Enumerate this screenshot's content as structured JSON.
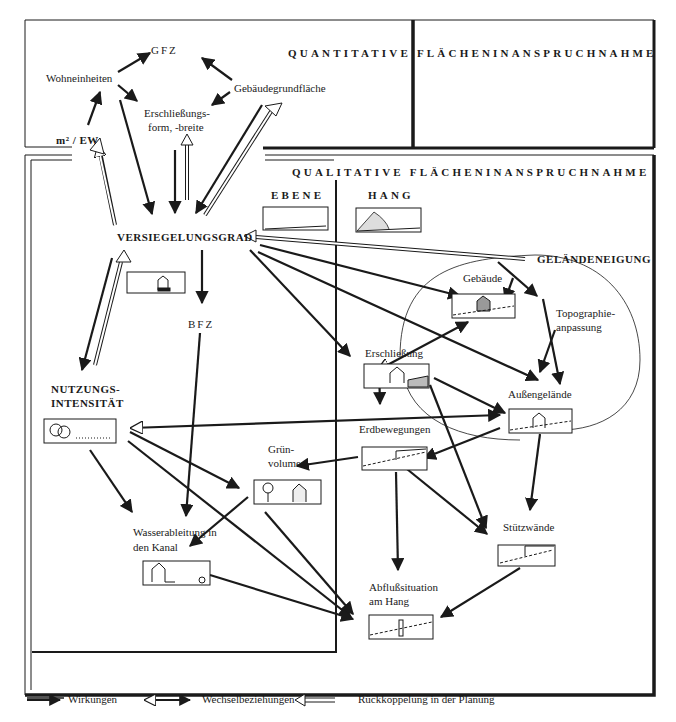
{
  "sections": {
    "quantitative_title": "QUANTITATIVE FLÄCHENINANSPRUCHNAHME",
    "qualitative_title": "QUALITATIVE FLÄCHENINANSPRUCHNAHME",
    "ebene": "EBENE",
    "hang": "HANG"
  },
  "nodes": {
    "gfz": "GFZ",
    "wohneinheiten": "Wohneinheiten",
    "gebaeudegrundflaeche": "Gebäudegrundfläche",
    "erschliessungsform_1": "Erschließungs-",
    "erschliessungsform_2": "form, -breite",
    "m2_ew": "m² / EW",
    "versiegelungsgrad": "VERSIEGELUNGSGRAD",
    "bfz": "BFZ",
    "nutzungsintensitaet_1": "NUTZUNGS-",
    "nutzungsintensitaet_2": "INTENSITÄT",
    "gelaendeneigung": "GELÄNDENEIGUNG",
    "gebaeude": "Gebäude",
    "topographie_1": "Topographie-",
    "topographie_2": "anpassung",
    "erschliessung": "Erschließung",
    "aussengelaende": "Außengelände",
    "erdbewegungen": "Erdbewegungen",
    "gruen_1": "Grün-",
    "gruen_2": "volumen",
    "wasser_1": "Wasserableitung in",
    "wasser_2": "den Kanal",
    "stuetzwaende": "Stützwände",
    "abfluss_1": "Abflußsituation",
    "abfluss_2": "am Hang"
  },
  "legend": [
    {
      "label": "Wirkungen",
      "icon": "solid-arrow"
    },
    {
      "label": "Wechselbeziehungen",
      "icon": "double-headed-arrow"
    },
    {
      "label": "Rückkoppelung in der Planung",
      "icon": "hollow-feedback-arrow"
    }
  ],
  "colors": {
    "ink": "#1a1a1a",
    "paper": "#ffffff"
  }
}
